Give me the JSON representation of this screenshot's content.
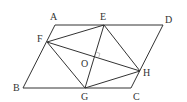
{
  "diagram": {
    "type": "geometry",
    "colors": {
      "line": "#333333",
      "label": "#333333",
      "background": "#ffffff"
    },
    "points": {
      "A": {
        "label": "A",
        "x": 55,
        "y": 25
      },
      "E": {
        "label": "E",
        "x": 104,
        "y": 25
      },
      "D": {
        "label": "D",
        "x": 163,
        "y": 25
      },
      "F": {
        "label": "F",
        "x": 47,
        "y": 42
      },
      "B": {
        "label": "B",
        "x": 23,
        "y": 88
      },
      "G": {
        "label": "G",
        "x": 85,
        "y": 88
      },
      "C": {
        "label": "C",
        "x": 131,
        "y": 88
      },
      "H": {
        "label": "H",
        "x": 140,
        "y": 71
      },
      "O": {
        "label": "O",
        "x": 95,
        "y": 56
      }
    },
    "segments": [
      [
        "A",
        "D"
      ],
      [
        "D",
        "C"
      ],
      [
        "C",
        "B"
      ],
      [
        "B",
        "A"
      ],
      [
        "E",
        "F"
      ],
      [
        "F",
        "G"
      ],
      [
        "G",
        "H"
      ],
      [
        "H",
        "E"
      ],
      [
        "E",
        "G"
      ],
      [
        "F",
        "H"
      ]
    ],
    "right_angle_mark": {
      "at": "O",
      "between": [
        "E",
        "H"
      ]
    }
  }
}
